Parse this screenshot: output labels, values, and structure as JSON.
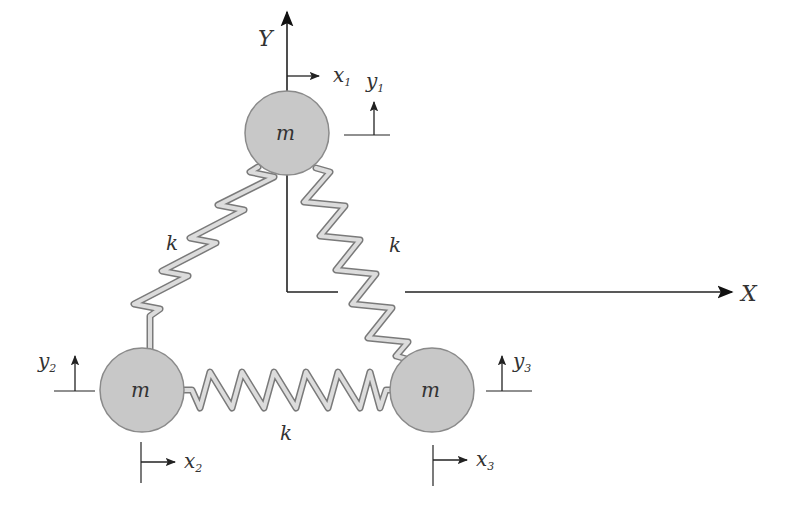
{
  "diagram": {
    "type": "three-mass spring system",
    "colors": {
      "mass_fill": "#c8c8c8",
      "mass_stroke": "#8a8a8a",
      "spring_fill": "#d8d8d8",
      "spring_stroke": "#7a7a7a",
      "axis": "#222222",
      "text": "#333333"
    },
    "axes": {
      "x_label": "X",
      "y_label": "Y"
    },
    "masses": [
      {
        "id": "mass-1",
        "label": "m",
        "cx": 287,
        "cy": 133,
        "r": 42,
        "x_disp": "x",
        "x_sub": "1",
        "y_disp": "y",
        "y_sub": "1"
      },
      {
        "id": "mass-2",
        "label": "m",
        "cx": 142,
        "cy": 390,
        "r": 42,
        "x_disp": "x",
        "x_sub": "2",
        "y_disp": "y",
        "y_sub": "2"
      },
      {
        "id": "mass-3",
        "label": "m",
        "cx": 432,
        "cy": 390,
        "r": 42,
        "x_disp": "x",
        "x_sub": "3",
        "y_disp": "y",
        "y_sub": "3"
      }
    ],
    "springs": [
      {
        "id": "spring-1-2",
        "label": "k"
      },
      {
        "id": "spring-1-3",
        "label": "k"
      },
      {
        "id": "spring-2-3",
        "label": "k"
      }
    ]
  }
}
